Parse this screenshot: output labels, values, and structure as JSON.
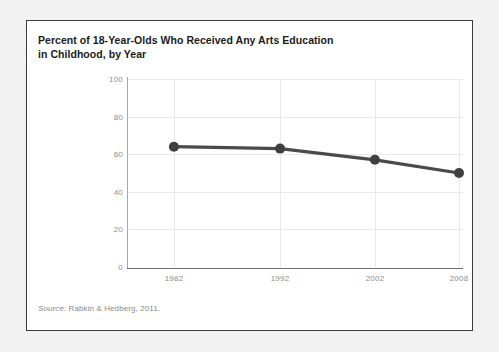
{
  "figure": {
    "title_line_1": "Percent of 18-Year-Olds Who Received Any Arts Education",
    "title_line_2": "in Childhood, by Year",
    "source_label": "Source:",
    "source_text": "Rabkin & Hedberg, 2011.",
    "line_color": "#4a4a4a",
    "marker_color": "#3f3f3f",
    "grid_color": "#e9e9ec",
    "tick_label_color": "#8d8d8d",
    "frame_border_color": "#3b3b3b",
    "page_background": "#f2f2f2",
    "panel_background": "#ffffff"
  },
  "chart_data": {
    "type": "line",
    "title": "Percent of 18-Year-Olds Who Received Any Arts Education in Childhood, by Year",
    "xlabel": "",
    "ylabel": "",
    "x": [
      1982,
      1992,
      2002,
      2008
    ],
    "categories": [
      "1982",
      "1992",
      "2002",
      "2008"
    ],
    "values": [
      64,
      63,
      57,
      50
    ],
    "series": [
      {
        "name": "Percent receiving any arts education in childhood",
        "values": [
          64,
          63,
          57,
          50
        ]
      }
    ],
    "ylim": [
      0,
      100
    ],
    "yticks": [
      0,
      20,
      40,
      60,
      80,
      100
    ],
    "ytick_labels": [
      "0",
      "20",
      "40",
      "60",
      "80",
      "100"
    ],
    "xticks": [
      1982,
      1992,
      2002,
      2008
    ],
    "xtick_labels": [
      "1982",
      "1992",
      "2002",
      "2008"
    ],
    "xtick_positions_pct": [
      13.7,
      45.4,
      73.7,
      98.8
    ],
    "grid": "horizontal-and-vertical",
    "legend": "none",
    "markers": "circle",
    "annotations": []
  }
}
